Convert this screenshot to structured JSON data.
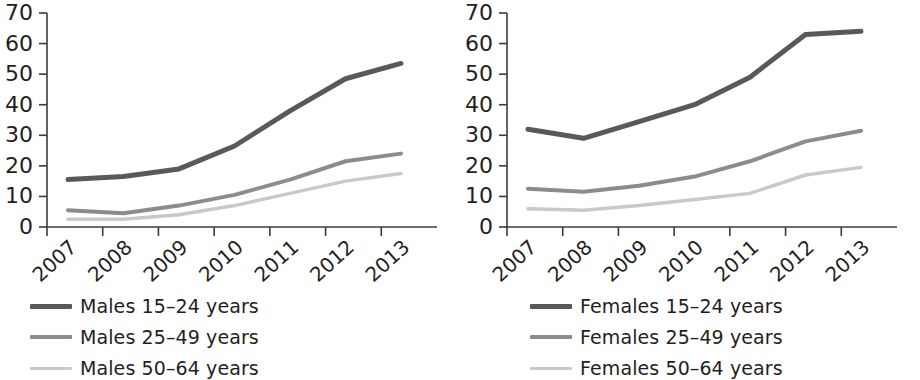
{
  "chart_data": [
    {
      "type": "line",
      "title": "Males",
      "xlabel": "",
      "ylabel": "",
      "x": [
        "2007",
        "2008",
        "2009",
        "2010",
        "2011",
        "2012",
        "2013"
      ],
      "categories": [
        "2007",
        "2008",
        "2009",
        "2010",
        "2011",
        "2012",
        "2013"
      ],
      "ylim": [
        0,
        70
      ],
      "yticks": [
        0,
        10,
        20,
        30,
        40,
        50,
        60,
        70
      ],
      "grid": false,
      "legend_position": "below",
      "series": [
        {
          "name": "Males 15–24 years",
          "color": "#595959",
          "width": 5,
          "values": [
            15.5,
            16.5,
            19.0,
            26.5,
            38.0,
            48.5,
            53.5
          ]
        },
        {
          "name": "Males 25–49 years",
          "color": "#8c8c8c",
          "width": 4,
          "values": [
            5.5,
            4.5,
            7.0,
            10.5,
            15.5,
            21.5,
            24.0
          ]
        },
        {
          "name": "Males 50–64 years",
          "color": "#c9c9c9",
          "width": 3.5,
          "values": [
            2.5,
            2.5,
            4.0,
            7.0,
            11.0,
            15.0,
            17.5
          ]
        }
      ]
    },
    {
      "type": "line",
      "title": "Females",
      "xlabel": "",
      "ylabel": "",
      "x": [
        "2007",
        "2008",
        "2009",
        "2010",
        "2011",
        "2012",
        "2013"
      ],
      "categories": [
        "2007",
        "2008",
        "2009",
        "2010",
        "2011",
        "2012",
        "2013"
      ],
      "ylim": [
        0,
        70
      ],
      "yticks": [
        0,
        10,
        20,
        30,
        40,
        50,
        60,
        70
      ],
      "grid": false,
      "legend_position": "below",
      "series": [
        {
          "name": "Females 15–24 years",
          "color": "#595959",
          "width": 5,
          "values": [
            32.0,
            29.0,
            34.5,
            40.0,
            49.0,
            63.0,
            64.0
          ]
        },
        {
          "name": "Females 25–49 years",
          "color": "#8c8c8c",
          "width": 4,
          "values": [
            12.5,
            11.5,
            13.5,
            16.5,
            21.5,
            28.0,
            31.5
          ]
        },
        {
          "name": "Females 50–64 years",
          "color": "#c9c9c9",
          "width": 3.5,
          "values": [
            6.0,
            5.5,
            7.0,
            9.0,
            11.0,
            17.0,
            19.5
          ]
        }
      ]
    }
  ],
  "panels": [
    {
      "id": "males",
      "ytick_labels": [
        "70",
        "60",
        "50",
        "40",
        "30",
        "20",
        "10",
        "0"
      ],
      "xtick_labels": [
        "2007",
        "2008",
        "2009",
        "2010",
        "2011",
        "2012",
        "2013"
      ],
      "legend": [
        {
          "label": "Males 15–24 years",
          "color": "#595959",
          "thickness": "5px"
        },
        {
          "label": "Males 25–49 years",
          "color": "#8c8c8c",
          "thickness": "4px"
        },
        {
          "label": "Males 50–64 years",
          "color": "#c9c9c9",
          "thickness": "3px"
        }
      ]
    },
    {
      "id": "females",
      "ytick_labels": [
        "70",
        "60",
        "50",
        "40",
        "30",
        "20",
        "10",
        "0"
      ],
      "xtick_labels": [
        "2007",
        "2008",
        "2009",
        "2010",
        "2011",
        "2012",
        "2013"
      ],
      "legend": [
        {
          "label": "Females 15–24 years",
          "color": "#595959",
          "thickness": "5px"
        },
        {
          "label": "Females 25–49 years",
          "color": "#8c8c8c",
          "thickness": "4px"
        },
        {
          "label": "Females 50–64 years",
          "color": "#c9c9c9",
          "thickness": "3px"
        }
      ]
    }
  ],
  "colors": {
    "axis": "#3b3b3b",
    "text": "#231f20",
    "series_dark": "#595959",
    "series_mid": "#8c8c8c",
    "series_light": "#c9c9c9",
    "background": "#ffffff"
  }
}
